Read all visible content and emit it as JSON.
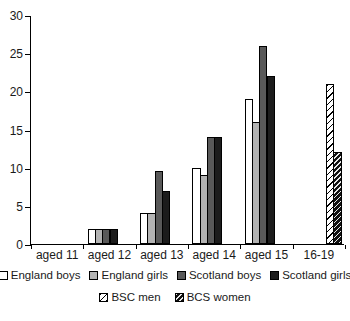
{
  "chart_data": {
    "type": "bar",
    "title": "",
    "xlabel": "",
    "ylabel": "",
    "categories": [
      "aged 11",
      "aged 12",
      "aged 13",
      "aged 14",
      "aged 15",
      "16-19"
    ],
    "series": [
      {
        "name": "England boys",
        "style": "white",
        "values": [
          0,
          2,
          4,
          10,
          19,
          null
        ]
      },
      {
        "name": "England girls",
        "style": "light-gray",
        "values": [
          0,
          2,
          4,
          9,
          16,
          null
        ]
      },
      {
        "name": "Scotland boys",
        "style": "dark-gray",
        "values": [
          0,
          2,
          9.5,
          14,
          26,
          null
        ]
      },
      {
        "name": "Scotland girls",
        "style": "black",
        "values": [
          0,
          2,
          7,
          14,
          22,
          null
        ]
      },
      {
        "name": "BSC men",
        "style": "hatch-light",
        "values": [
          null,
          null,
          null,
          null,
          null,
          21
        ]
      },
      {
        "name": "BCS women",
        "style": "hatch-dark",
        "values": [
          null,
          null,
          null,
          null,
          null,
          12
        ]
      }
    ],
    "ylim": [
      0,
      30
    ],
    "yticks": [
      0,
      5,
      10,
      15,
      20,
      25,
      30
    ],
    "grid": false,
    "legend_position": "bottom",
    "legend_rows": [
      [
        "England boys",
        "England girls",
        "Scotland boys",
        "Scotland girls"
      ],
      [
        "BSC men",
        "BCS women"
      ]
    ],
    "colors": {
      "white": "#ffffff",
      "light-gray": "#b3b3b3",
      "dark-gray": "#595959",
      "black": "#1c1c1c",
      "axis": "#000000"
    }
  }
}
